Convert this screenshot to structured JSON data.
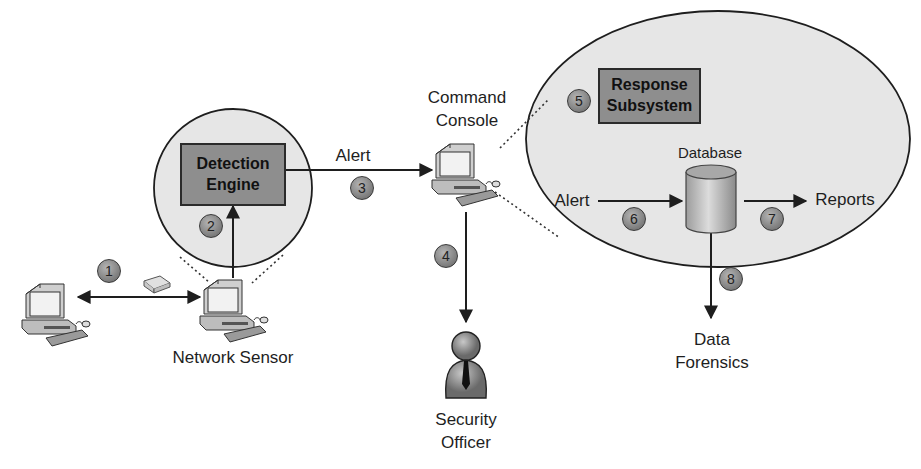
{
  "diagram": {
    "title": "",
    "colors": {
      "zone_fill": "#e8e8e8",
      "box_fill": "#8e8e8e",
      "line": "#1e1e1e",
      "step_badge": "#8a8a8a"
    },
    "nodes": {
      "host_computer": {
        "icon": "computer-icon",
        "label": ""
      },
      "network_sensor": {
        "icon": "computer-icon",
        "label": "Network Sensor"
      },
      "packet": {
        "icon": "envelope-icon",
        "label": ""
      },
      "detection_engine": {
        "label_line1": "Detection",
        "label_line2": "Engine"
      },
      "command_console": {
        "icon": "computer-icon",
        "label_line1": "Command",
        "label_line2": "Console"
      },
      "response_subsystem": {
        "label_line1": "Response",
        "label_line2": "Subsystem"
      },
      "database": {
        "icon": "database-cylinder-icon",
        "label": "Database"
      },
      "security_officer": {
        "icon": "person-icon",
        "label_line1": "Security",
        "label_line2": "Officer"
      },
      "reports": {
        "label": "Reports"
      },
      "data_forensics": {
        "label_line1": "Data",
        "label_line2": "Forensics"
      }
    },
    "edges": [
      {
        "step": "1",
        "from": "host_computer",
        "to": "network_sensor",
        "label": "",
        "bidirectional": true
      },
      {
        "step": "2",
        "from": "network_sensor",
        "to": "detection_engine",
        "label": ""
      },
      {
        "step": "3",
        "from": "detection_engine",
        "to": "command_console",
        "label": "Alert"
      },
      {
        "step": "4",
        "from": "command_console",
        "to": "security_officer",
        "label": ""
      },
      {
        "step": "5",
        "from": "command_console",
        "to": "response_subsystem",
        "label": ""
      },
      {
        "step": "6",
        "from": "alert_input",
        "to": "database",
        "label": "Alert"
      },
      {
        "step": "7",
        "from": "database",
        "to": "reports",
        "label": ""
      },
      {
        "step": "8",
        "from": "database",
        "to": "data_forensics",
        "label": ""
      }
    ],
    "steps": [
      "1",
      "2",
      "3",
      "4",
      "5",
      "6",
      "7",
      "8"
    ]
  }
}
